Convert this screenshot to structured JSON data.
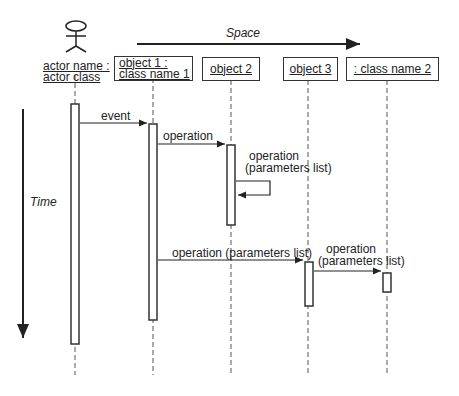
{
  "axes": {
    "space_label": "Space",
    "time_label": "Time"
  },
  "actor": {
    "name_line1": "actor name :",
    "name_line2": "actor class"
  },
  "objects": [
    {
      "line1": "object 1 :",
      "line2": "class name 1"
    },
    {
      "line1": "object 2"
    },
    {
      "line1": "object 3"
    },
    {
      "line1": ": class name 2"
    }
  ],
  "messages": [
    {
      "label": "event"
    },
    {
      "label": "operation"
    },
    {
      "label_line1": "operation",
      "label_line2": "(parameters list)"
    },
    {
      "label": "operation (parameters list)"
    },
    {
      "label_line1": "operation",
      "label_line2": "(parameters list)"
    }
  ],
  "colors": {
    "line": "#333333",
    "lifeline": "#555555"
  }
}
